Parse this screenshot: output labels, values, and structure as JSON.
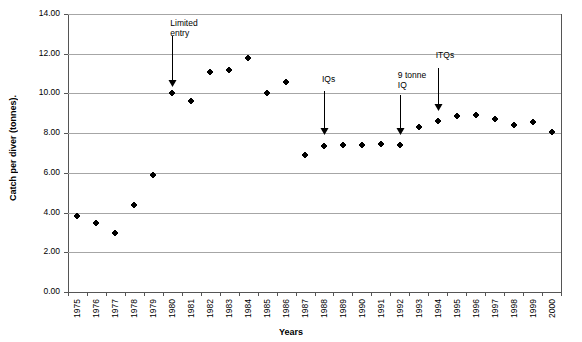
{
  "chart_data": {
    "type": "scatter",
    "title": "",
    "xlabel": "Years",
    "ylabel": "Catch per diver (tonnes).",
    "xlim": [
      1975,
      2000
    ],
    "ylim": [
      0,
      14
    ],
    "ytick_labels": [
      "14.00",
      "12.00",
      "10.00",
      "8.00",
      "6.00",
      "4.00",
      "2.00",
      "0.00"
    ],
    "ytick_values": [
      14,
      12,
      10,
      8,
      6,
      4,
      2,
      0
    ],
    "grid": "horizontal",
    "legend": "none",
    "categories": [
      1975,
      1976,
      1977,
      1978,
      1979,
      1980,
      1981,
      1982,
      1983,
      1984,
      1985,
      1986,
      1987,
      1988,
      1989,
      1990,
      1991,
      1992,
      1993,
      1994,
      1995,
      1996,
      1997,
      1998,
      1999,
      2000
    ],
    "xtick_labels": [
      "1975",
      "1976",
      "1977",
      "1978",
      "1979",
      "1980",
      "1981",
      "1982",
      "1983",
      "1984",
      "1985",
      "1986",
      "1987",
      "1988",
      "1989",
      "1990",
      "1991",
      "1992",
      "1993",
      "1994",
      "1995",
      "1996",
      "1997",
      "1998",
      "1999",
      "2000"
    ],
    "values": [
      3.85,
      3.5,
      2.95,
      4.4,
      5.9,
      10.0,
      9.6,
      11.1,
      11.2,
      11.8,
      10.0,
      10.6,
      6.9,
      7.35,
      7.4,
      7.4,
      7.45,
      7.4,
      8.3,
      8.6,
      8.85,
      8.9,
      8.7,
      8.4,
      8.55,
      8.05
    ],
    "series": [
      {
        "name": "Catch per diver",
        "marker": "filled-diamond",
        "color": "#000000",
        "values": [
          3.85,
          3.5,
          2.95,
          4.4,
          5.9,
          10.0,
          9.6,
          11.1,
          11.2,
          11.8,
          10.0,
          10.6,
          6.9,
          7.35,
          7.4,
          7.4,
          7.45,
          7.4,
          8.3,
          8.6,
          8.85,
          8.9,
          8.7,
          8.4,
          8.55,
          8.05
        ]
      }
    ],
    "annotations": [
      {
        "id": "limited-entry",
        "label": "Limited\nentry",
        "x": 1980,
        "text_y": 13.3,
        "arrow_from_y": 12.9,
        "arrow_to_y": 10.3
      },
      {
        "id": "iqs",
        "label": "IQs",
        "x": 1988,
        "text_y": 10.5,
        "arrow_from_y": 10.1,
        "arrow_to_y": 7.9
      },
      {
        "id": "nine-tonne-iq",
        "label": "9 tonne\nIQ",
        "x": 1992,
        "text_y": 10.7,
        "arrow_from_y": 9.9,
        "arrow_to_y": 7.9
      },
      {
        "id": "itqs",
        "label": "ITQs",
        "x": 1994,
        "text_y": 11.7,
        "arrow_from_y": 11.3,
        "arrow_to_y": 9.1
      }
    ]
  }
}
